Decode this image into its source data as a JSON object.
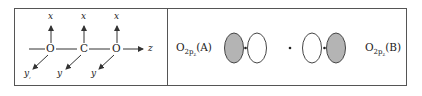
{
  "left_panel": {
    "atoms": [
      "O",
      "C",
      "O"
    ],
    "axis_x_labels": [
      "x",
      "x",
      "x"
    ],
    "axis_y_labels": [
      "y",
      "y",
      "y"
    ],
    "axis_y_first_subscript": ",",
    "axis_z_label": "z"
  },
  "right_panel": {
    "label_a": {
      "main": "O",
      "sub": "2p",
      "subsub": "z",
      "suffix": "(A)"
    },
    "label_b": {
      "main": "O",
      "sub": "2p",
      "subsub": "z",
      "suffix": "(B)"
    },
    "lobes": [
      {
        "fill": "#b4b4b4",
        "shaded": true
      },
      {
        "fill": "#ffffff",
        "shaded": false
      },
      {
        "fill": "#ffffff",
        "shaded": false
      },
      {
        "fill": "#b4b4b4",
        "shaded": true
      }
    ]
  },
  "colors": {
    "line": "#333333",
    "shaded_lobe": "#b4b4b4",
    "frame": "#555555"
  }
}
